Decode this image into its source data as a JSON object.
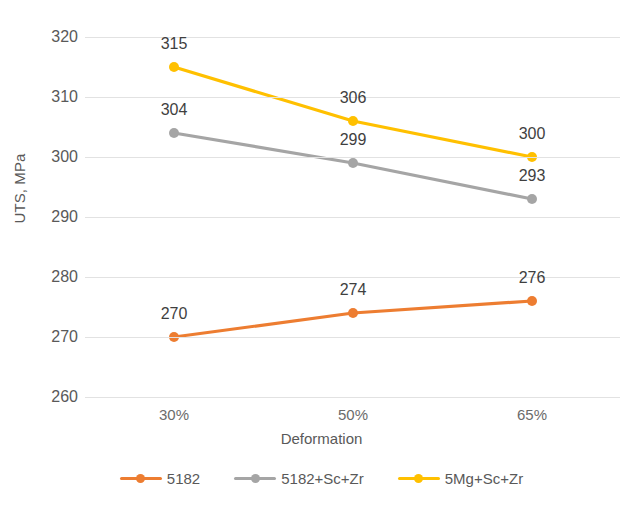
{
  "chart_data": {
    "type": "line",
    "title": "",
    "xlabel": "Deformation",
    "ylabel": "UTS, MPa",
    "categories": [
      "30%",
      "50%",
      "65%"
    ],
    "ylim": [
      260,
      320
    ],
    "ytick_step": 10,
    "yticks": [
      "320",
      "310",
      "300",
      "290",
      "280",
      "270",
      "260"
    ],
    "grid": true,
    "legend_position": "bottom",
    "series": [
      {
        "name": "5182",
        "color": "#ED7D31",
        "values": [
          270,
          274,
          276
        ],
        "labels": [
          "270",
          "274",
          "276"
        ]
      },
      {
        "name": "5182+Sc+Zr",
        "color": "#A5A5A5",
        "values": [
          304,
          299,
          293
        ],
        "labels": [
          "304",
          "299",
          "293"
        ]
      },
      {
        "name": "5Mg+Sc+Zr",
        "color": "#FFC000",
        "values": [
          315,
          306,
          300
        ],
        "labels": [
          "315",
          "306",
          "300"
        ]
      }
    ]
  },
  "axes": {
    "y_title": "UTS, MPa",
    "x_title": "Deformation"
  },
  "colors": {
    "gridline": "#E2E2E2",
    "text": "#595959",
    "label_text": "#3F3F3F",
    "background": "#FFFFFF"
  }
}
